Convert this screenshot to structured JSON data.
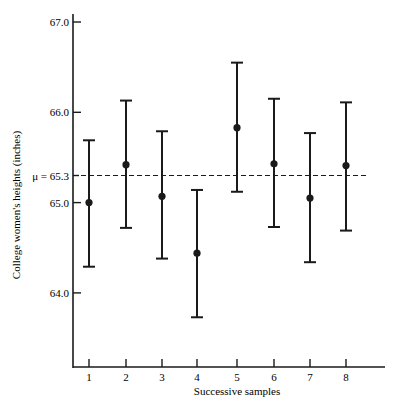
{
  "chart_data": {
    "type": "scatter",
    "subtype": "error_bar",
    "title": "",
    "xlabel": "Successive samples",
    "ylabel": "College women's heights (inches)",
    "ylim": [
      63.2,
      67.3
    ],
    "grid": false,
    "legend": null,
    "y_ticks": [
      {
        "value": 67.0,
        "label": "67.0"
      },
      {
        "value": 66.0,
        "label": "66.0"
      },
      {
        "value": 65.0,
        "label": "65.0"
      },
      {
        "value": 64.0,
        "label": "64.0"
      }
    ],
    "reference_line": {
      "value": 65.3,
      "label": "μ = 65.3",
      "style": "dashed"
    },
    "categories": [
      "1",
      "2",
      "3",
      "4",
      "5",
      "6",
      "7",
      "8"
    ],
    "series": [
      {
        "name": "Sample mean with confidence interval",
        "means": [
          65.0,
          65.42,
          65.07,
          64.44,
          65.83,
          65.43,
          65.05,
          65.41
        ],
        "upper": [
          65.69,
          66.13,
          65.79,
          65.14,
          66.55,
          66.15,
          65.77,
          66.11
        ],
        "lower": [
          64.29,
          64.72,
          64.38,
          63.73,
          65.12,
          64.73,
          64.34,
          64.69
        ]
      }
    ]
  }
}
